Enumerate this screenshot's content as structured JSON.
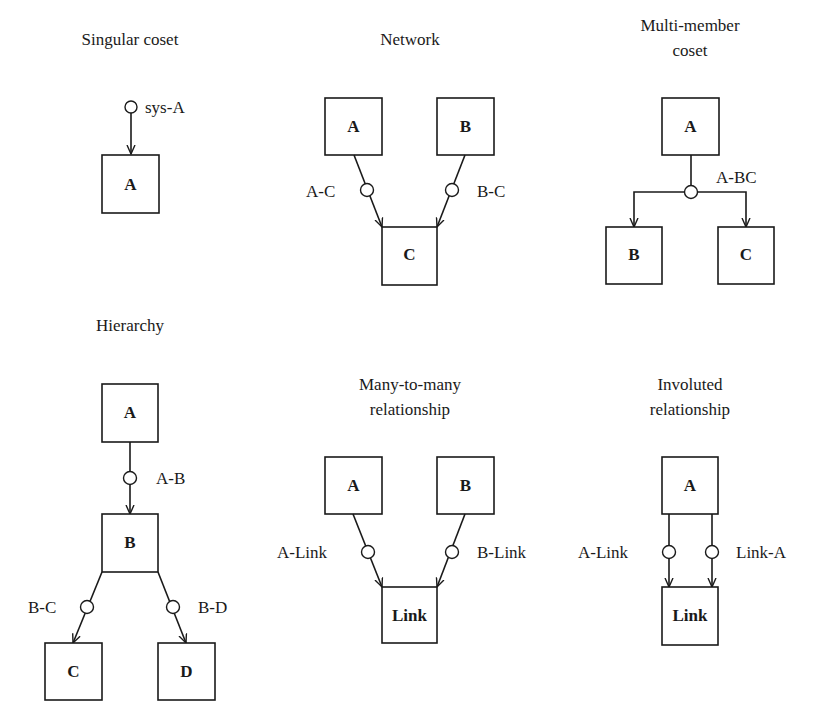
{
  "panels": {
    "singular": {
      "title": [
        "Singular coset"
      ],
      "boxes": {
        "a": "A"
      },
      "relations": {
        "sys_a": "sys-A"
      }
    },
    "network": {
      "title": [
        "Network"
      ],
      "boxes": {
        "a": "A",
        "b": "B",
        "c": "C"
      },
      "relations": {
        "a_c": "A-C",
        "b_c": "B-C"
      }
    },
    "multi_member": {
      "title": [
        "Multi-member",
        "coset"
      ],
      "boxes": {
        "a": "A",
        "b": "B",
        "c": "C"
      },
      "relations": {
        "a_bc": "A-BC"
      }
    },
    "hierarchy": {
      "title": [
        "Hierarchy"
      ],
      "boxes": {
        "a": "A",
        "b": "B",
        "c": "C",
        "d": "D"
      },
      "relations": {
        "a_b": "A-B",
        "b_c": "B-C",
        "b_d": "B-D"
      }
    },
    "many_to_many": {
      "title": [
        "Many-to-many",
        "relationship"
      ],
      "boxes": {
        "a": "A",
        "b": "B",
        "link": "Link"
      },
      "relations": {
        "a_link": "A-Link",
        "b_link": "B-Link"
      }
    },
    "involuted": {
      "title": [
        "Involuted",
        "relationship"
      ],
      "boxes": {
        "a": "A",
        "link": "Link"
      },
      "relations": {
        "a_link": "A-Link",
        "link_a": "Link-A"
      }
    }
  },
  "colors": {
    "ink": "#1a1a1a",
    "background": "#ffffff"
  }
}
